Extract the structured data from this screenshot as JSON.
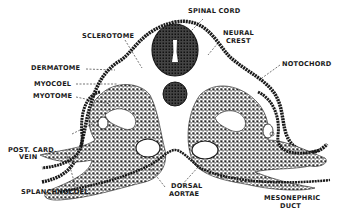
{
  "colors": {
    "ink": "#1a1a1a",
    "background": "#ffffff",
    "tissue_fill": "#6e6e6e"
  },
  "labels": {
    "spinal_cord": "SPINAL CORD",
    "sclerotome": "SCLEROTOME",
    "neural_crest_1": "NEURAL",
    "neural_crest_2": "CREST",
    "notochord": "NOTOCHORD",
    "dermatome": "DERMATOME",
    "myocoel": "MYOCOEL",
    "myotome": "MYOTOME",
    "post_card_vein_1": "POST. CARD.",
    "post_card_vein_2": "VEIN",
    "splanchnocoel": "SPLANCHNOCOEL",
    "dorsal_aortae_1": "DORSAL",
    "dorsal_aortae_2": "AORTAE",
    "mesonephric_duct_1": "MESONEPHRIC",
    "mesonephric_duct_2": "DUCT"
  }
}
